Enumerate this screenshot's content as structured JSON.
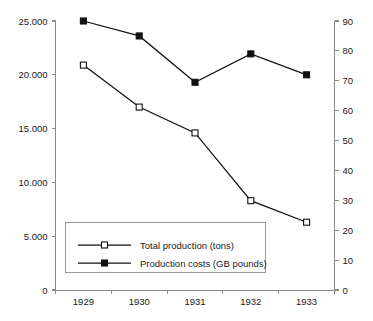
{
  "chart_data": {
    "type": "line",
    "title": "",
    "subtitle": "",
    "xlabel": "",
    "ylabel": "",
    "categories": [
      "1929",
      "1930",
      "1931",
      "1932",
      "1933"
    ],
    "grid": false,
    "legend_position": "inside-bottom-left",
    "axes": {
      "left": {
        "label": "",
        "min": 0,
        "max": 25000,
        "step": 5000,
        "ticks": [
          "0",
          "5.000",
          "10.000",
          "15.000",
          "20.000",
          "25.000"
        ],
        "tick_values": [
          0,
          5000,
          10000,
          15000,
          20000,
          25000
        ]
      },
      "right": {
        "label": "",
        "min": 0,
        "max": 90,
        "step": 10,
        "ticks": [
          "0",
          "10",
          "20",
          "30",
          "40",
          "50",
          "60",
          "70",
          "80",
          "90"
        ],
        "tick_values": [
          0,
          10,
          20,
          30,
          40,
          50,
          60,
          70,
          80,
          90
        ]
      },
      "bottom": {
        "ticks": [
          "1929",
          "1930",
          "1931",
          "1932",
          "1933"
        ]
      }
    },
    "series": [
      {
        "name": "Total production (tons)",
        "axis": "left",
        "marker": "open-square",
        "color": "#111111",
        "values": [
          20900,
          17000,
          14600,
          8300,
          6300
        ]
      },
      {
        "name": "Production costs (GB pounds)",
        "axis": "right",
        "marker": "filled-square",
        "color": "#111111",
        "values": [
          90,
          85,
          69.5,
          79,
          72
        ]
      }
    ]
  },
  "legend": {
    "entries": [
      {
        "label": "Total production (tons)",
        "marker": "open-square"
      },
      {
        "label": "Production costs (GB pounds)",
        "marker": "filled-square"
      }
    ]
  },
  "colors": {
    "series": "#111111",
    "axis": "#8a8a8a",
    "text": "#1a1a1a",
    "legend_border": "#9a9a9a",
    "background": "#ffffff"
  }
}
